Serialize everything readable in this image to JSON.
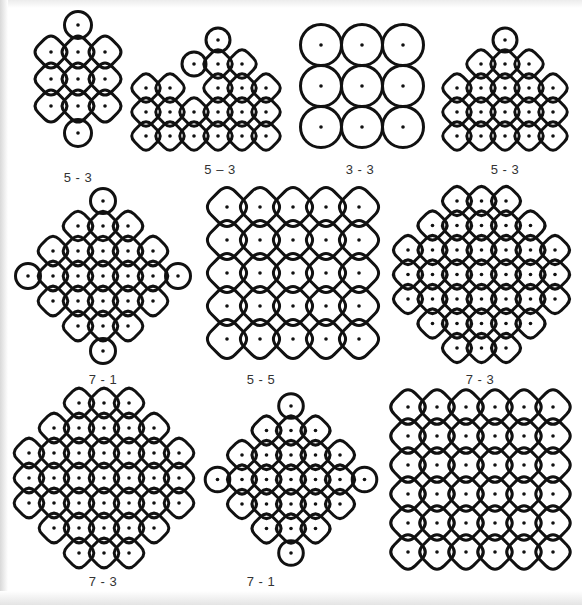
{
  "figure": {
    "colors": {
      "stroke": "#111111",
      "dot": "#111111",
      "label": "#333333",
      "background": "#ffffff"
    },
    "kolams": [
      {
        "label": "5 - 3",
        "label_pos": [
          78,
          178
        ],
        "origin": [
          78,
          25
        ],
        "spacing": 27,
        "dots": [
          [
            0,
            0
          ],
          [
            -1,
            1
          ],
          [
            0,
            1
          ],
          [
            1,
            1
          ],
          [
            -1,
            2
          ],
          [
            0,
            2
          ],
          [
            1,
            2
          ],
          [
            -1,
            3
          ],
          [
            0,
            3
          ],
          [
            1,
            3
          ],
          [
            0,
            4
          ]
        ],
        "mode": "chain"
      },
      {
        "label": "5 – 3",
        "label_pos": [
          220,
          170
        ],
        "origin": [
          218,
          40
        ],
        "spacing": 24,
        "dots": [
          [
            0,
            0
          ],
          [
            -1,
            1
          ],
          [
            0,
            1
          ],
          [
            1,
            1
          ],
          [
            0,
            2
          ],
          [
            -2,
            2
          ],
          [
            -3,
            2
          ],
          [
            1,
            2
          ],
          [
            2,
            2
          ],
          [
            -3,
            3
          ],
          [
            -2,
            3
          ],
          [
            -1,
            3
          ],
          [
            0,
            3
          ],
          [
            1,
            3
          ],
          [
            2,
            3
          ],
          [
            -3,
            4
          ],
          [
            -2,
            4
          ],
          [
            -1,
            4
          ],
          [
            0,
            4
          ],
          [
            1,
            4
          ],
          [
            2,
            4
          ]
        ],
        "mode": "lattice"
      },
      {
        "label": "3 - 3",
        "label_pos": [
          360,
          170
        ],
        "origin": [
          321,
          45
        ],
        "spacing": 41,
        "dots": [
          [
            0,
            0
          ],
          [
            1,
            0
          ],
          [
            2,
            0
          ],
          [
            0,
            1
          ],
          [
            1,
            1
          ],
          [
            2,
            1
          ],
          [
            0,
            2
          ],
          [
            1,
            2
          ],
          [
            2,
            2
          ]
        ],
        "mode": "loops"
      },
      {
        "label": "5 - 3",
        "label_pos": [
          505,
          170
        ],
        "origin": [
          505,
          40
        ],
        "spacing": 24,
        "dots": [
          [
            0,
            0
          ],
          [
            -1,
            1
          ],
          [
            0,
            1
          ],
          [
            1,
            1
          ],
          [
            -2,
            2
          ],
          [
            -1,
            2
          ],
          [
            0,
            2
          ],
          [
            1,
            2
          ],
          [
            2,
            2
          ],
          [
            -2,
            3
          ],
          [
            -1,
            3
          ],
          [
            0,
            3
          ],
          [
            1,
            3
          ],
          [
            2,
            3
          ],
          [
            -2,
            4
          ],
          [
            -1,
            4
          ],
          [
            0,
            4
          ],
          [
            1,
            4
          ],
          [
            2,
            4
          ]
        ],
        "mode": "lattice"
      },
      {
        "label": "7 - 1",
        "label_pos": [
          103,
          380
        ],
        "origin": [
          103,
          201
        ],
        "spacing": 25,
        "dots": [
          [
            0,
            0
          ],
          [
            -1,
            1
          ],
          [
            0,
            1
          ],
          [
            1,
            1
          ],
          [
            -2,
            2
          ],
          [
            -1,
            2
          ],
          [
            0,
            2
          ],
          [
            1,
            2
          ],
          [
            2,
            2
          ],
          [
            -3,
            3
          ],
          [
            -2,
            3
          ],
          [
            -1,
            3
          ],
          [
            0,
            3
          ],
          [
            1,
            3
          ],
          [
            2,
            3
          ],
          [
            3,
            3
          ],
          [
            -2,
            4
          ],
          [
            -1,
            4
          ],
          [
            0,
            4
          ],
          [
            1,
            4
          ],
          [
            2,
            4
          ],
          [
            -1,
            5
          ],
          [
            0,
            5
          ],
          [
            1,
            5
          ],
          [
            0,
            6
          ]
        ],
        "mode": "lattice"
      },
      {
        "label": "5 - 5",
        "label_pos": [
          261,
          380
        ],
        "origin": [
          227,
          207
        ],
        "spacing": 33,
        "dots": [
          [
            0,
            0
          ],
          [
            1,
            0
          ],
          [
            2,
            0
          ],
          [
            3,
            0
          ],
          [
            4,
            0
          ],
          [
            0,
            1
          ],
          [
            1,
            1
          ],
          [
            2,
            1
          ],
          [
            3,
            1
          ],
          [
            4,
            1
          ],
          [
            0,
            2
          ],
          [
            1,
            2
          ],
          [
            2,
            2
          ],
          [
            3,
            2
          ],
          [
            4,
            2
          ],
          [
            0,
            3
          ],
          [
            1,
            3
          ],
          [
            2,
            3
          ],
          [
            3,
            3
          ],
          [
            4,
            3
          ],
          [
            0,
            4
          ],
          [
            1,
            4
          ],
          [
            2,
            4
          ],
          [
            3,
            4
          ],
          [
            4,
            4
          ]
        ],
        "mode": "lattice"
      },
      {
        "label": "7 - 3",
        "label_pos": [
          480,
          380
        ],
        "origin": [
          408,
          201
        ],
        "spacing": 24.5,
        "dots": [
          [
            2,
            0
          ],
          [
            3,
            0
          ],
          [
            4,
            0
          ],
          [
            1,
            1
          ],
          [
            2,
            1
          ],
          [
            3,
            1
          ],
          [
            4,
            1
          ],
          [
            5,
            1
          ],
          [
            0,
            2
          ],
          [
            1,
            2
          ],
          [
            2,
            2
          ],
          [
            3,
            2
          ],
          [
            4,
            2
          ],
          [
            5,
            2
          ],
          [
            6,
            2
          ],
          [
            0,
            3
          ],
          [
            1,
            3
          ],
          [
            2,
            3
          ],
          [
            3,
            3
          ],
          [
            4,
            3
          ],
          [
            5,
            3
          ],
          [
            6,
            3
          ],
          [
            0,
            4
          ],
          [
            1,
            4
          ],
          [
            2,
            4
          ],
          [
            3,
            4
          ],
          [
            4,
            4
          ],
          [
            5,
            4
          ],
          [
            6,
            4
          ],
          [
            1,
            5
          ],
          [
            2,
            5
          ],
          [
            3,
            5
          ],
          [
            4,
            5
          ],
          [
            5,
            5
          ],
          [
            2,
            6
          ],
          [
            3,
            6
          ],
          [
            4,
            6
          ]
        ],
        "mode": "lattice"
      },
      {
        "label": "7 - 3",
        "label_pos": [
          103,
          582
        ],
        "origin": [
          29,
          403
        ],
        "spacing": 25,
        "dots": [
          [
            2,
            0
          ],
          [
            3,
            0
          ],
          [
            4,
            0
          ],
          [
            1,
            1
          ],
          [
            2,
            1
          ],
          [
            3,
            1
          ],
          [
            4,
            1
          ],
          [
            5,
            1
          ],
          [
            0,
            2
          ],
          [
            1,
            2
          ],
          [
            2,
            2
          ],
          [
            3,
            2
          ],
          [
            4,
            2
          ],
          [
            5,
            2
          ],
          [
            6,
            2
          ],
          [
            0,
            3
          ],
          [
            1,
            3
          ],
          [
            2,
            3
          ],
          [
            3,
            3
          ],
          [
            4,
            3
          ],
          [
            5,
            3
          ],
          [
            6,
            3
          ],
          [
            0,
            4
          ],
          [
            1,
            4
          ],
          [
            2,
            4
          ],
          [
            3,
            4
          ],
          [
            4,
            4
          ],
          [
            5,
            4
          ],
          [
            6,
            4
          ],
          [
            1,
            5
          ],
          [
            2,
            5
          ],
          [
            3,
            5
          ],
          [
            4,
            5
          ],
          [
            5,
            5
          ],
          [
            2,
            6
          ],
          [
            3,
            6
          ],
          [
            4,
            6
          ]
        ],
        "mode": "lattice"
      },
      {
        "label": "7 - 1",
        "label_pos": [
          261,
          582
        ],
        "origin": [
          291,
          406
        ],
        "spacing": 24.5,
        "dots": [
          [
            -1,
            1
          ],
          [
            0,
            0
          ],
          [
            1,
            1
          ],
          [
            0,
            1
          ],
          [
            -3,
            3
          ],
          [
            -2,
            2
          ],
          [
            -1,
            2
          ],
          [
            0,
            2
          ],
          [
            1,
            2
          ],
          [
            2,
            2
          ],
          [
            -2,
            3
          ],
          [
            -1,
            3
          ],
          [
            0,
            3
          ],
          [
            1,
            3
          ],
          [
            2,
            3
          ],
          [
            3,
            3
          ],
          [
            -2,
            4
          ],
          [
            -1,
            4
          ],
          [
            0,
            4
          ],
          [
            1,
            4
          ],
          [
            2,
            4
          ],
          [
            -1,
            5
          ],
          [
            0,
            5
          ],
          [
            1,
            5
          ],
          [
            0,
            6
          ]
        ],
        "mode": "lattice"
      },
      {
        "label": "6 - 6",
        "label_pos": [
          475,
          582
        ],
        "origin": [
          408,
          407
        ],
        "spacing": 29,
        "dots": [
          [
            0,
            0
          ],
          [
            1,
            0
          ],
          [
            2,
            0
          ],
          [
            3,
            0
          ],
          [
            4,
            0
          ],
          [
            5,
            0
          ],
          [
            0,
            1
          ],
          [
            1,
            1
          ],
          [
            2,
            1
          ],
          [
            3,
            1
          ],
          [
            4,
            1
          ],
          [
            5,
            1
          ],
          [
            0,
            2
          ],
          [
            1,
            2
          ],
          [
            2,
            2
          ],
          [
            3,
            2
          ],
          [
            4,
            2
          ],
          [
            5,
            2
          ],
          [
            0,
            3
          ],
          [
            1,
            3
          ],
          [
            2,
            3
          ],
          [
            3,
            3
          ],
          [
            4,
            3
          ],
          [
            5,
            3
          ],
          [
            0,
            4
          ],
          [
            1,
            4
          ],
          [
            2,
            4
          ],
          [
            3,
            4
          ],
          [
            4,
            4
          ],
          [
            5,
            4
          ],
          [
            0,
            5
          ],
          [
            1,
            5
          ],
          [
            2,
            5
          ],
          [
            3,
            5
          ],
          [
            4,
            5
          ],
          [
            5,
            5
          ]
        ],
        "mode": "lattice"
      }
    ]
  }
}
